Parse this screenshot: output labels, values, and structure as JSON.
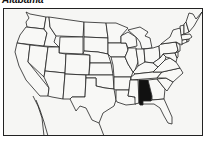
{
  "title": "Alabama",
  "map": {
    "region": "United States (contiguous)",
    "highlighted_state": "Alabama",
    "highlight_color": "#111111",
    "state_fill": "#f8f8f6",
    "border_color": "#222222"
  }
}
